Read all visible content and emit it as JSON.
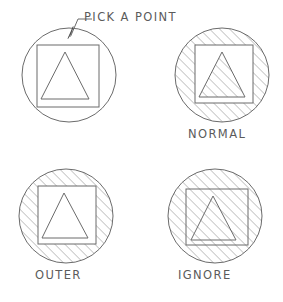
{
  "figure": {
    "title": "",
    "kind": "cad-line-drawing",
    "stroke_color": "#6b6b6b",
    "hatch_color": "#8a8a8a",
    "background_color": "#ffffff",
    "text_color": "#5b5b5b",
    "hatch_angle_degrees": 45,
    "hatch_spacing_px": 5
  },
  "callout": {
    "label": "PICK A POINT",
    "arrow_tip": {
      "x": 68,
      "y": 38
    },
    "elbow": {
      "x": 78,
      "y": 19
    },
    "shoulder_end": {
      "x": 92,
      "y": 19
    }
  },
  "panels": [
    {
      "id": "pick-a-point",
      "label": "PICK A POINT",
      "label_visible": true,
      "hatch_style": "none",
      "hatch_regions": [],
      "circle": {
        "cx": 69,
        "cy": 75,
        "r": 47
      },
      "square": {
        "x": 37,
        "y": 45,
        "w": 62,
        "h": 62
      },
      "triangle": {
        "apex_x": 65,
        "apex_y": 52,
        "left_x": 41,
        "right_x": 89,
        "base_y": 99
      }
    },
    {
      "id": "normal",
      "label": "NORMAL",
      "label_visible": true,
      "hatch_style": "normal",
      "hatch_regions": [
        "circle-minus-square",
        "triangle"
      ],
      "circle": {
        "cx": 222,
        "cy": 75,
        "r": 47
      },
      "square": {
        "x": 195,
        "y": 45,
        "w": 58,
        "h": 58
      },
      "triangle": {
        "apex_x": 222,
        "apex_y": 52,
        "left_x": 199,
        "right_x": 245,
        "base_y": 97
      }
    },
    {
      "id": "outer",
      "label": "OUTER",
      "label_visible": true,
      "hatch_style": "outer",
      "hatch_regions": [
        "circle-minus-square"
      ],
      "circle": {
        "cx": 66,
        "cy": 216,
        "r": 47
      },
      "square": {
        "x": 38,
        "y": 186,
        "w": 58,
        "h": 58
      },
      "triangle": {
        "apex_x": 64,
        "apex_y": 193,
        "left_x": 42,
        "right_x": 88,
        "base_y": 238
      }
    },
    {
      "id": "ignore",
      "label": "IGNORE",
      "label_visible": true,
      "hatch_style": "ignore",
      "hatch_regions": [
        "whole-circle"
      ],
      "circle": {
        "cx": 215,
        "cy": 216,
        "r": 47
      },
      "square": {
        "x": 186,
        "y": 189,
        "w": 62,
        "h": 56
      },
      "triangle": {
        "apex_x": 213,
        "apex_y": 196,
        "left_x": 191,
        "right_x": 236,
        "base_y": 240
      }
    }
  ]
}
